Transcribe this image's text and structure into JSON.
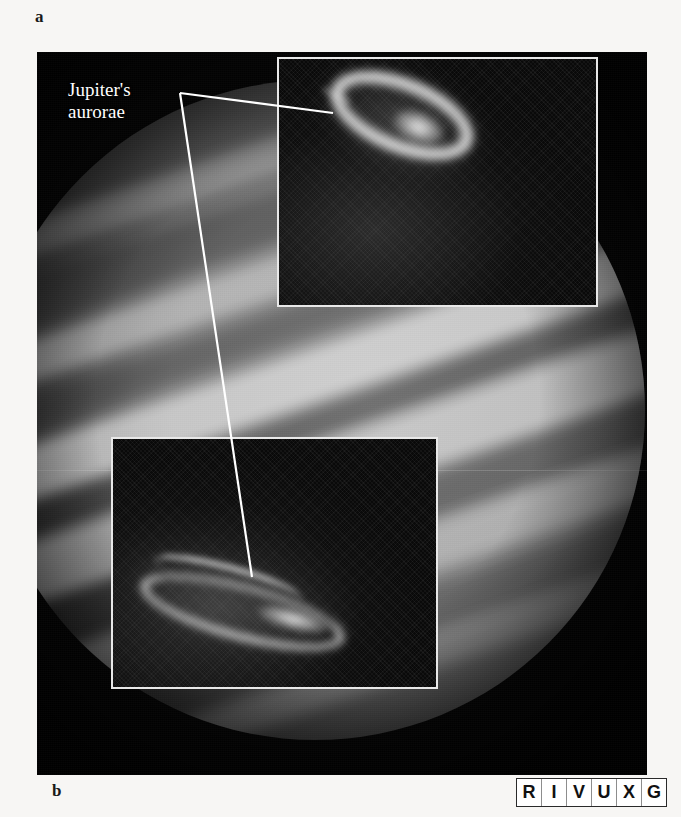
{
  "figure": {
    "panel_a_label": "a",
    "panel_b_label": "b",
    "callout_line1": "Jupiter's",
    "callout_line2": "aurorae",
    "subject": "Jupiter",
    "background_color": "#050505",
    "page_color": "#f7f6f4",
    "annotation_color": "#ffffff"
  },
  "insets": {
    "north": {
      "name": "northern-aurora-inset",
      "border_color": "#e8e8e8",
      "description": "elliptical auroral oval at Jupiter's north pole"
    },
    "south": {
      "name": "southern-aurora-inset",
      "border_color": "#e8e8e8",
      "description": "flattened elongated auroral arc at Jupiter's south pole"
    }
  },
  "wavelength_indicator": {
    "name": "RIVUXG",
    "cells": [
      {
        "letter": "R",
        "active": true
      },
      {
        "letter": "I",
        "active": true
      },
      {
        "letter": "V",
        "active": true
      },
      {
        "letter": "U",
        "active": true
      },
      {
        "letter": "X",
        "active": true
      },
      {
        "letter": "G",
        "active": true
      }
    ]
  }
}
